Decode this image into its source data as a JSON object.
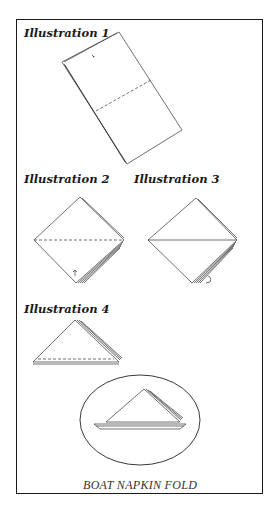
{
  "illustrations": [
    {
      "label": "Illustration 1"
    },
    {
      "label": "Illustration 2"
    },
    {
      "label": "Illustration 3"
    },
    {
      "label": "Illustration 4"
    }
  ],
  "caption": "BOAT NAPKIN FOLD",
  "colors": {
    "ink": "#1a1a1a",
    "background": "#ffffff"
  }
}
